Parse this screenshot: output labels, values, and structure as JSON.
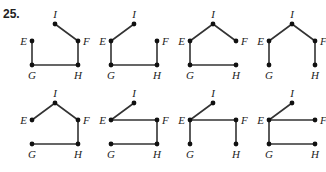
{
  "problem": {
    "number": "25."
  },
  "vertex_labels": [
    "E",
    "F",
    "G",
    "H",
    "I"
  ],
  "colors": {
    "edge": "#333333",
    "vertex": "#111111",
    "label": "#222222"
  },
  "graphs": [
    {
      "id": 1,
      "row": 1,
      "col": 1,
      "vertices": {
        "I": [
          55,
          24
        ],
        "E": [
          32,
          41
        ],
        "F": [
          78,
          41
        ],
        "G": [
          32,
          65
        ],
        "H": [
          78,
          65
        ]
      },
      "edges": [
        [
          "I",
          "F"
        ],
        [
          "F",
          "H"
        ],
        [
          "G",
          "H"
        ],
        [
          "E",
          "G"
        ]
      ]
    },
    {
      "id": 2,
      "row": 1,
      "col": 2,
      "vertices": {
        "I": [
          134,
          24
        ],
        "E": [
          111,
          41
        ],
        "F": [
          157,
          41
        ],
        "G": [
          111,
          65
        ],
        "H": [
          157,
          65
        ]
      },
      "edges": [
        [
          "E",
          "I"
        ],
        [
          "E",
          "G"
        ],
        [
          "G",
          "H"
        ],
        [
          "F",
          "H"
        ]
      ]
    },
    {
      "id": 3,
      "row": 1,
      "col": 3,
      "vertices": {
        "I": [
          213,
          24
        ],
        "E": [
          190,
          41
        ],
        "F": [
          236,
          41
        ],
        "G": [
          190,
          65
        ],
        "H": [
          236,
          65
        ]
      },
      "edges": [
        [
          "E",
          "I"
        ],
        [
          "I",
          "F"
        ],
        [
          "E",
          "G"
        ],
        [
          "G",
          "H"
        ]
      ]
    },
    {
      "id": 4,
      "row": 1,
      "col": 4,
      "vertices": {
        "I": [
          292,
          24
        ],
        "E": [
          269,
          41
        ],
        "F": [
          315,
          41
        ],
        "G": [
          269,
          65
        ],
        "H": [
          315,
          65
        ]
      },
      "edges": [
        [
          "E",
          "I"
        ],
        [
          "I",
          "F"
        ],
        [
          "E",
          "G"
        ],
        [
          "F",
          "H"
        ]
      ]
    },
    {
      "id": 5,
      "row": 2,
      "col": 1,
      "vertices": {
        "I": [
          55,
          103
        ],
        "E": [
          32,
          120
        ],
        "F": [
          78,
          120
        ],
        "G": [
          32,
          144
        ],
        "H": [
          78,
          144
        ]
      },
      "edges": [
        [
          "E",
          "I"
        ],
        [
          "I",
          "F"
        ],
        [
          "F",
          "H"
        ],
        [
          "G",
          "H"
        ]
      ]
    },
    {
      "id": 6,
      "row": 2,
      "col": 2,
      "vertices": {
        "I": [
          134,
          103
        ],
        "E": [
          111,
          120
        ],
        "F": [
          157,
          120
        ],
        "G": [
          111,
          144
        ],
        "H": [
          157,
          144
        ]
      },
      "edges": [
        [
          "E",
          "I"
        ],
        [
          "E",
          "F"
        ],
        [
          "F",
          "H"
        ],
        [
          "G",
          "H"
        ]
      ]
    },
    {
      "id": 7,
      "row": 2,
      "col": 3,
      "vertices": {
        "I": [
          213,
          103
        ],
        "E": [
          190,
          120
        ],
        "F": [
          236,
          120
        ],
        "G": [
          190,
          144
        ],
        "H": [
          236,
          144
        ]
      },
      "edges": [
        [
          "E",
          "I"
        ],
        [
          "E",
          "F"
        ],
        [
          "E",
          "G"
        ],
        [
          "F",
          "H"
        ]
      ]
    },
    {
      "id": 8,
      "row": 2,
      "col": 4,
      "vertices": {
        "I": [
          292,
          103
        ],
        "E": [
          269,
          120
        ],
        "F": [
          315,
          120
        ],
        "G": [
          269,
          144
        ],
        "H": [
          315,
          144
        ]
      },
      "edges": [
        [
          "E",
          "I"
        ],
        [
          "E",
          "F"
        ],
        [
          "E",
          "G"
        ],
        [
          "G",
          "H"
        ]
      ]
    }
  ]
}
